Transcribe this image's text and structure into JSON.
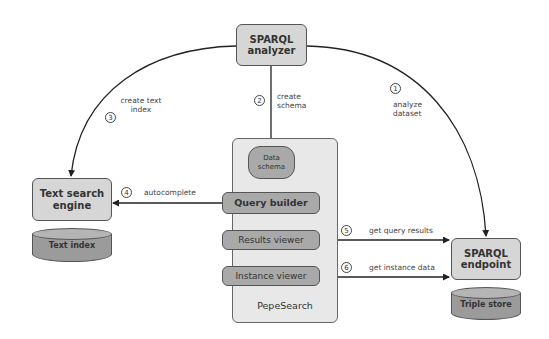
{
  "diagram": {
    "nodes": {
      "sparql_analyzer": {
        "line1": "SPARQL",
        "line2": "analyzer"
      },
      "text_search_engine": {
        "line1": "Text search",
        "line2": "engine"
      },
      "text_index": {
        "label": "Text index"
      },
      "pepesearch": {
        "title": "PepeSearch",
        "data_schema": {
          "line1": "Data",
          "line2": "schema"
        },
        "query_builder": "Query builder",
        "results_viewer": "Results viewer",
        "instance_viewer": "Instance viewer"
      },
      "sparql_endpoint": {
        "line1": "SPARQL",
        "line2": "endpoint"
      },
      "triple_store": {
        "label": "Triple store"
      }
    },
    "edges": [
      {
        "step": "1",
        "line1": "analyze",
        "line2": "dataset",
        "from": "SPARQL analyzer",
        "to": "SPARQL endpoint"
      },
      {
        "step": "2",
        "line1": "create",
        "line2": "schema",
        "from": "SPARQL analyzer",
        "to": "Data schema"
      },
      {
        "step": "3",
        "line1": "create text",
        "line2": "index",
        "from": "SPARQL analyzer",
        "to": "Text search engine"
      },
      {
        "step": "4",
        "label": "autocomplete",
        "from": "Query builder",
        "to": "Text search engine"
      },
      {
        "step": "5",
        "label": "get query results",
        "from": "Results viewer",
        "to": "SPARQL endpoint"
      },
      {
        "step": "6",
        "label": "get instance data",
        "from": "Instance viewer",
        "to": "SPARQL endpoint"
      }
    ]
  }
}
